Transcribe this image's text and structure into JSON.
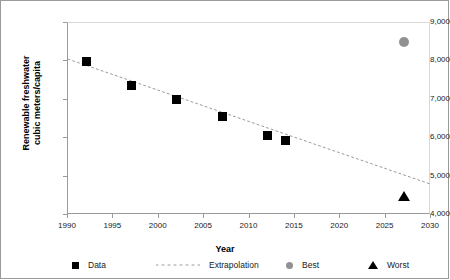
{
  "chart_data": {
    "type": "scatter",
    "title": "",
    "xlabel": "Year",
    "ylabel": "Renewable freshwater cubic meters/capita",
    "ylabel_line1": "Renewable freshwater",
    "ylabel_line2": "cubic meters/capita",
    "xlim": [
      1990,
      2030
    ],
    "ylim": [
      4000,
      9000
    ],
    "grid": false,
    "legend_position": "bottom",
    "xticks": [
      1990,
      1995,
      2000,
      2005,
      2010,
      2015,
      2020,
      2025,
      2030
    ],
    "xtick_labels": [
      "1990",
      "1995",
      "2000",
      "2005",
      "2010",
      "2015",
      "2020",
      "2025",
      "2030"
    ],
    "yticks": [
      4000,
      5000,
      6000,
      7000,
      8000,
      9000
    ],
    "ytick_labels": [
      "4,000",
      "5,000",
      "6,000",
      "7,000",
      "8,000",
      "9,000"
    ],
    "series": [
      {
        "name": "Data",
        "marker": "square",
        "color": "#000000",
        "points": [
          {
            "x": 1992,
            "y": 8000
          },
          {
            "x": 1997,
            "y": 7380
          },
          {
            "x": 2002,
            "y": 7000
          },
          {
            "x": 2007,
            "y": 6560
          },
          {
            "x": 2012,
            "y": 6080
          },
          {
            "x": 2014,
            "y": 5930
          }
        ]
      },
      {
        "name": "Extrapolation",
        "marker": "none",
        "linestyle": "dotted",
        "color": "#9a9a9a",
        "points": [
          {
            "x": 1990,
            "y": 8060
          },
          {
            "x": 2030,
            "y": 4800
          }
        ]
      },
      {
        "name": "Best",
        "marker": "circle",
        "color": "#919191",
        "points": [
          {
            "x": 2027,
            "y": 8500
          }
        ]
      },
      {
        "name": "Worst",
        "marker": "triangle",
        "color": "#000000",
        "points": [
          {
            "x": 2027,
            "y": 4470
          }
        ]
      }
    ],
    "legend_entries": [
      {
        "label": "Data",
        "marker": "square",
        "color": "#000000"
      },
      {
        "label": "Extrapolation",
        "marker": "dotted-line",
        "color": "#9a9a9a"
      },
      {
        "label": "Best",
        "marker": "circle",
        "color": "#919191"
      },
      {
        "label": "Worst",
        "marker": "triangle",
        "color": "#000000"
      }
    ]
  }
}
